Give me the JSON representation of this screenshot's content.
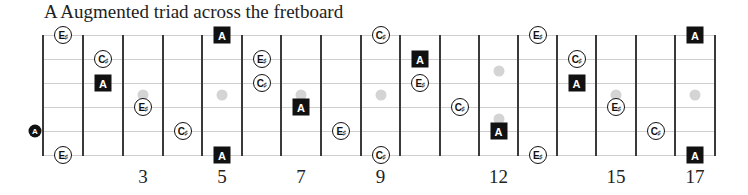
{
  "title": "A Augmented triad across the fretboard",
  "layout": {
    "string_y": [
      35,
      59,
      83,
      107,
      131,
      155
    ],
    "fret_x": [
      43,
      83,
      123,
      163,
      202,
      242,
      281,
      321,
      361,
      400,
      440,
      479,
      518,
      557,
      596,
      636,
      675,
      715
    ],
    "string_start_x": 43,
    "string_end_x": 715
  },
  "colors": {
    "fret_line": "#3a3a3a",
    "string_line": "#cfcfcf",
    "inlay": "#d4d4d4",
    "root_fill": "#111111",
    "note_outline": "#111111"
  },
  "fret_numbers": [
    {
      "label": "3",
      "fret": 3
    },
    {
      "label": "5",
      "fret": 5
    },
    {
      "label": "7",
      "fret": 7
    },
    {
      "label": "9",
      "fret": 9
    },
    {
      "label": "12",
      "fret": 12
    },
    {
      "label": "15",
      "fret": 15
    },
    {
      "label": "17",
      "fret": 17
    }
  ],
  "inlays": [
    {
      "fret": 3,
      "y": 95
    },
    {
      "fret": 5,
      "y": 95
    },
    {
      "fret": 7,
      "y": 95
    },
    {
      "fret": 9,
      "y": 95
    },
    {
      "fret": 12,
      "y": 71
    },
    {
      "fret": 12,
      "y": 119
    },
    {
      "fret": 15,
      "y": 95
    },
    {
      "fret": 17,
      "y": 95
    }
  ],
  "open_notes": [
    {
      "name": "A",
      "string": 5,
      "x": 35,
      "style": "open"
    }
  ],
  "notes": [
    {
      "name": "E",
      "acc": "♯",
      "fret": 1,
      "string": 1,
      "style": "circle"
    },
    {
      "name": "E",
      "acc": "♯",
      "fret": 1,
      "string": 6,
      "style": "circle"
    },
    {
      "name": "C",
      "acc": "♯",
      "fret": 2,
      "string": 2,
      "style": "circle"
    },
    {
      "name": "A",
      "acc": "",
      "fret": 2,
      "string": 3,
      "style": "square"
    },
    {
      "name": "E",
      "acc": "♯",
      "fret": 3,
      "string": 4,
      "style": "circle"
    },
    {
      "name": "C",
      "acc": "♯",
      "fret": 4,
      "string": 5,
      "style": "circle"
    },
    {
      "name": "A",
      "acc": "",
      "fret": 5,
      "string": 1,
      "style": "square"
    },
    {
      "name": "A",
      "acc": "",
      "fret": 5,
      "string": 6,
      "style": "square"
    },
    {
      "name": "E",
      "acc": "♯",
      "fret": 6,
      "string": 2,
      "style": "circle"
    },
    {
      "name": "C",
      "acc": "♯",
      "fret": 6,
      "string": 3,
      "style": "circle"
    },
    {
      "name": "A",
      "acc": "",
      "fret": 7,
      "string": 4,
      "style": "square"
    },
    {
      "name": "E",
      "acc": "♯",
      "fret": 8,
      "string": 5,
      "style": "circle"
    },
    {
      "name": "C",
      "acc": "♯",
      "fret": 9,
      "string": 1,
      "style": "circle"
    },
    {
      "name": "C",
      "acc": "♯",
      "fret": 9,
      "string": 6,
      "style": "circle"
    },
    {
      "name": "A",
      "acc": "",
      "fret": 10,
      "string": 2,
      "style": "square"
    },
    {
      "name": "E",
      "acc": "♯",
      "fret": 10,
      "string": 3,
      "style": "circle"
    },
    {
      "name": "C",
      "acc": "♯",
      "fret": 11,
      "string": 4,
      "style": "circle"
    },
    {
      "name": "A",
      "acc": "",
      "fret": 12,
      "string": 5,
      "style": "square"
    },
    {
      "name": "E",
      "acc": "♯",
      "fret": 13,
      "string": 1,
      "style": "circle"
    },
    {
      "name": "E",
      "acc": "♯",
      "fret": 13,
      "string": 6,
      "style": "circle"
    },
    {
      "name": "C",
      "acc": "♯",
      "fret": 14,
      "string": 2,
      "style": "circle"
    },
    {
      "name": "A",
      "acc": "",
      "fret": 14,
      "string": 3,
      "style": "square"
    },
    {
      "name": "E",
      "acc": "♯",
      "fret": 15,
      "string": 4,
      "style": "circle"
    },
    {
      "name": "C",
      "acc": "♯",
      "fret": 16,
      "string": 5,
      "style": "circle"
    },
    {
      "name": "A",
      "acc": "",
      "fret": 17,
      "string": 1,
      "style": "square"
    },
    {
      "name": "A",
      "acc": "",
      "fret": 17,
      "string": 6,
      "style": "square"
    }
  ]
}
